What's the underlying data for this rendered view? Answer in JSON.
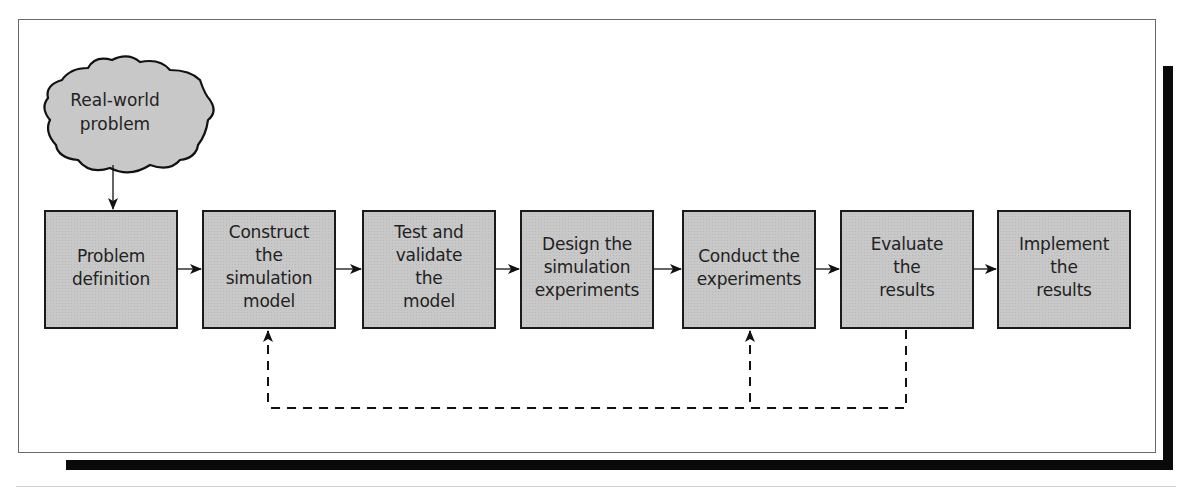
{
  "diagram": {
    "type": "flowchart",
    "title": "",
    "start_node": {
      "id": "real-world-problem",
      "label": "Real-world\nproblem",
      "shape": "cloud"
    },
    "steps": [
      {
        "id": "problem-definition",
        "label": "Problem\ndefinition",
        "pad_top": 33
      },
      {
        "id": "construct-model",
        "label": "Construct\nthe\nsimulation\nmodel",
        "pad_top": 9
      },
      {
        "id": "test-validate",
        "label": "Test and\nvalidate\nthe\nmodel",
        "pad_top": 9
      },
      {
        "id": "design-experiments",
        "label": "Design the\nsimulation\nexperiments",
        "pad_top": 21
      },
      {
        "id": "conduct-experiments",
        "label": "Conduct the\nexperiments",
        "pad_top": 33
      },
      {
        "id": "evaluate-results",
        "label": "Evaluate\nthe\nresults",
        "pad_top": 21
      },
      {
        "id": "implement-results",
        "label": "Implement\nthe\nresults",
        "pad_top": 21
      }
    ],
    "edges": [
      {
        "from": "real-world-problem",
        "to": "problem-definition",
        "style": "solid"
      },
      {
        "from": "problem-definition",
        "to": "construct-model",
        "style": "solid"
      },
      {
        "from": "construct-model",
        "to": "test-validate",
        "style": "solid"
      },
      {
        "from": "test-validate",
        "to": "design-experiments",
        "style": "solid"
      },
      {
        "from": "design-experiments",
        "to": "conduct-experiments",
        "style": "solid"
      },
      {
        "from": "conduct-experiments",
        "to": "evaluate-results",
        "style": "solid"
      },
      {
        "from": "evaluate-results",
        "to": "implement-results",
        "style": "solid"
      },
      {
        "from": "evaluate-results",
        "to": "construct-model",
        "style": "dashed",
        "kind": "feedback"
      },
      {
        "from": "evaluate-results",
        "to": "conduct-experiments",
        "style": "dashed",
        "kind": "feedback"
      }
    ],
    "colors": {
      "box_fill": "#c8c8c8",
      "stroke": "#1a1a1a",
      "frame": "#6a6a6a",
      "shadow": "#0a0a0a"
    }
  }
}
